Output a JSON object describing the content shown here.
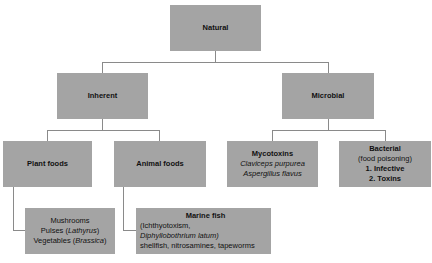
{
  "diagram": {
    "root": {
      "label": "Natural"
    },
    "level1": {
      "inherent": {
        "label": "Inherent"
      },
      "microbial": {
        "label": "Microbial"
      }
    },
    "level2": {
      "plant_foods": {
        "label": "Plant foods"
      },
      "animal_foods": {
        "label": "Animal foods"
      },
      "mycotoxins": {
        "label": "Mycotoxins",
        "items": [
          "Claviceps purpurea",
          "Aspergillus flavus"
        ]
      },
      "bacterial": {
        "label": "Bacterial",
        "sublabel": "(food poisoning)",
        "items": [
          "1. Infective",
          "2. Toxins"
        ]
      }
    },
    "level3": {
      "plant_examples": {
        "line1": "Mushrooms",
        "line2_prefix": "Pulses (",
        "line2_italic": "Lathyrus",
        "line2_suffix": ")",
        "line3_prefix": "Vegetables (",
        "line3_italic": "Brassica",
        "line3_suffix": ")"
      },
      "animal_examples": {
        "title": "Marine fish",
        "line1": "(Ichthyotoxism,",
        "line2": "Diphyllobothrium latum)",
        "line3": "shellfish, nitrosamines, tapeworms"
      }
    },
    "colors": {
      "box_fill": "#a4a4a4",
      "connector": "#8a8a8a"
    }
  }
}
